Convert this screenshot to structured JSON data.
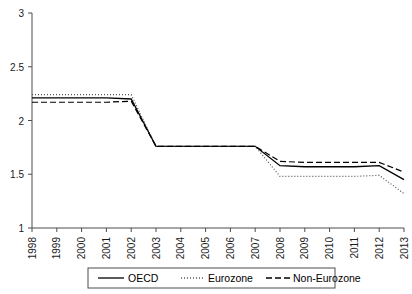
{
  "chart_data": {
    "type": "line",
    "title": "",
    "xlabel": "",
    "ylabel": "",
    "x": [
      1998,
      1999,
      2000,
      2001,
      2002,
      2003,
      2004,
      2005,
      2006,
      2007,
      2008,
      2009,
      2010,
      2011,
      2012,
      2013
    ],
    "xtick_labels": [
      "1998",
      "1999",
      "2000",
      "2001",
      "2002",
      "2003",
      "2004",
      "2005",
      "2006",
      "2007",
      "2008",
      "2009",
      "2010",
      "2011",
      "2012",
      "2013"
    ],
    "ytick_labels": [
      "1",
      "1.5",
      "2",
      "2.5",
      "3"
    ],
    "yticks": [
      1,
      1.5,
      2,
      2.5,
      3
    ],
    "ylim": [
      1,
      3
    ],
    "xlim": [
      1998,
      2013
    ],
    "grid": false,
    "legend_position": "bottom",
    "series": [
      {
        "name": "OECD",
        "style": "solid",
        "color": "#000000",
        "values": [
          2.21,
          2.21,
          2.21,
          2.21,
          2.2,
          1.76,
          1.76,
          1.76,
          1.76,
          1.76,
          1.58,
          1.57,
          1.57,
          1.57,
          1.58,
          1.45
        ]
      },
      {
        "name": "Eurozone",
        "style": "dotted",
        "color": "#555555",
        "values": [
          2.24,
          2.24,
          2.24,
          2.24,
          2.24,
          1.76,
          1.76,
          1.76,
          1.76,
          1.76,
          1.48,
          1.48,
          1.48,
          1.48,
          1.49,
          1.32
        ]
      },
      {
        "name": "Non-Eurozone",
        "style": "dashed",
        "color": "#000000",
        "values": [
          2.17,
          2.17,
          2.17,
          2.17,
          2.18,
          1.76,
          1.76,
          1.76,
          1.76,
          1.76,
          1.62,
          1.61,
          1.61,
          1.61,
          1.61,
          1.52
        ]
      }
    ]
  },
  "legend": {
    "items": [
      {
        "label": "OECD",
        "style": "solid"
      },
      {
        "label": "Eurozone",
        "style": "dotted"
      },
      {
        "label": "Non-Eurozone",
        "style": "dashed"
      }
    ]
  },
  "colors": {
    "axis": "#4d4d4d",
    "line_primary": "#000000",
    "line_dotted": "#555555",
    "legend_border": "#4d4d4d",
    "background": "#ffffff"
  }
}
